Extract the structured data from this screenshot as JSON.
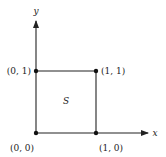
{
  "diagram": {
    "axes": {
      "x_label": "x",
      "y_label": "y"
    },
    "region_label": "S",
    "points": [
      {
        "label": "(0, 0)",
        "x": 0,
        "y": 0
      },
      {
        "label": "(1, 0)",
        "x": 1,
        "y": 0
      },
      {
        "label": "(1, 1)",
        "x": 1,
        "y": 1
      },
      {
        "label": "(0, 1)",
        "x": 0,
        "y": 1
      }
    ],
    "colors": {
      "line": "#222222",
      "background": "#ffffff"
    }
  }
}
